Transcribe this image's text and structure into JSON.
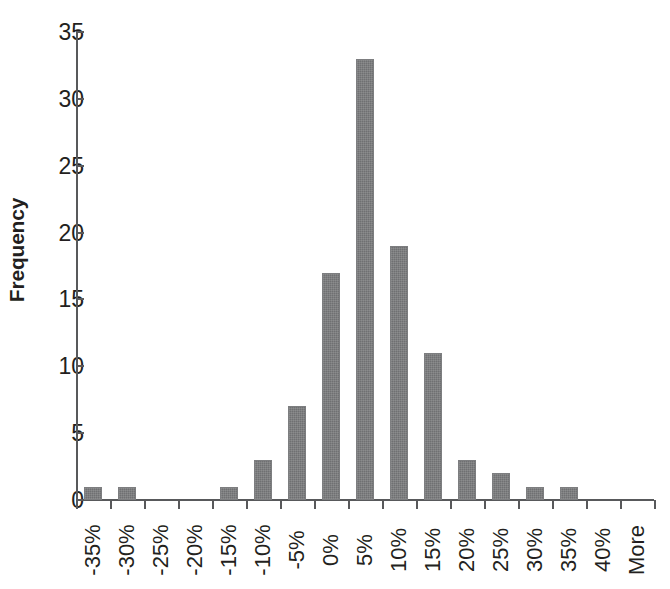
{
  "chart_data": {
    "type": "bar",
    "title": "",
    "subtitle": "",
    "xlabel": "",
    "ylabel": "Frequency",
    "categories": [
      "-35%",
      "-30%",
      "-25%",
      "-20%",
      "-15%",
      "-10%",
      "-5%",
      "0%",
      "5%",
      "10%",
      "15%",
      "20%",
      "25%",
      "30%",
      "35%",
      "40%",
      "More"
    ],
    "values": [
      1,
      1,
      0,
      0,
      1,
      3,
      7,
      17,
      33,
      19,
      11,
      3,
      2,
      1,
      1,
      0,
      0
    ],
    "ylim": [
      0,
      35
    ],
    "ytick_labels": [
      "0",
      "5",
      "10",
      "15",
      "20",
      "25",
      "30",
      "35"
    ],
    "ytick_values": [
      0,
      5,
      10,
      15,
      20,
      25,
      30,
      35
    ],
    "grid": false,
    "legend": false,
    "legend_position": "none",
    "bar_color": "#6f7072",
    "axis_color": "#58595b",
    "text_color": "#231f20",
    "background_color": "#ffffff"
  },
  "figure": {
    "caption_fragment": ""
  }
}
